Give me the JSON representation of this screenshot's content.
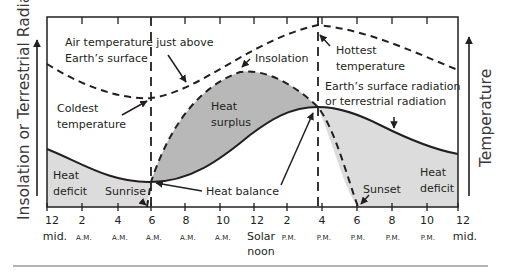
{
  "diagram": {
    "left_axis_title": "Insolation or Terrestrial Radiation",
    "right_axis_title": "Temperature",
    "annotations": {
      "air_temp": [
        "Air temperature just above",
        "Earth’s surface"
      ],
      "coldest": [
        "Coldest",
        "temperature"
      ],
      "insolation": "Insolation",
      "hottest": [
        "Hottest",
        "temperature"
      ],
      "terrestrial": [
        "Earth’s surface radiation",
        "or terrestrial radiation"
      ],
      "heat_surplus": [
        "Heat",
        "surplus"
      ],
      "heat_deficit_left": [
        "Heat",
        "deficit"
      ],
      "heat_deficit_right": [
        "Heat",
        "deficit"
      ],
      "sunrise": "Sunrise",
      "sunset": "Sunset",
      "heat_balance": "Heat balance"
    },
    "x_ticks": [
      {
        "hour": "12",
        "sub": "mid."
      },
      {
        "hour": "2",
        "sub": "A.M."
      },
      {
        "hour": "4",
        "sub": "A.M."
      },
      {
        "hour": "6",
        "sub": "A.M."
      },
      {
        "hour": "8",
        "sub": "A.M."
      },
      {
        "hour": "10",
        "sub": "A.M."
      },
      {
        "hour": "12",
        "sub": "Solar",
        "sub2": "noon"
      },
      {
        "hour": "2",
        "sub": "P.M."
      },
      {
        "hour": "4",
        "sub": "P.M."
      },
      {
        "hour": "6",
        "sub": "P.M."
      },
      {
        "hour": "8",
        "sub": "P.M."
      },
      {
        "hour": "10",
        "sub": "P.M."
      },
      {
        "hour": "12",
        "sub": "mid."
      }
    ],
    "colors": {
      "line": "#231f20",
      "surplus_fill": "#b3b3b3",
      "deficit_fill": "#d9d9d9"
    }
  }
}
